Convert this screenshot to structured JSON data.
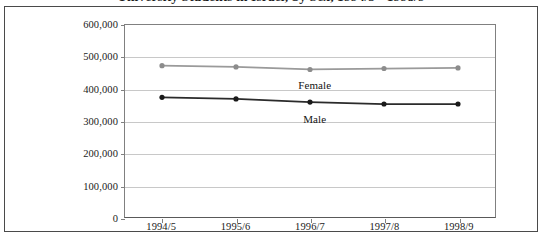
{
  "chart_data": {
    "type": "line",
    "title": "University Students in Israel, by Sex, 1994/5 - 1998/9",
    "xlabel": "",
    "ylabel": "",
    "categories": [
      "1994/5",
      "1995/6",
      "1996/7",
      "1997/8",
      "1998/9"
    ],
    "series": [
      {
        "name": "Female",
        "color": "#9a9a9a",
        "marker_color": "#8c8c8c",
        "values": [
          473000,
          469000,
          461000,
          464000,
          466000
        ],
        "label_x_index": 2.05,
        "label_y": 432000
      },
      {
        "name": "Male",
        "color": "#2b2b2b",
        "marker_color": "#1a1a1a",
        "values": [
          374000,
          369000,
          359000,
          353000,
          353000
        ],
        "label_x_index": 2.05,
        "label_y": 327000
      }
    ],
    "ylim": [
      0,
      600000
    ],
    "ytick_values": [
      0,
      100000,
      200000,
      300000,
      400000,
      500000,
      600000
    ],
    "ytick_labels": [
      "0",
      "100,000",
      "200,000",
      "300,000",
      "400,000",
      "500,000",
      "600,000"
    ],
    "grid": true,
    "grid_color": "#c8c8c8",
    "legend_position": "inline-annotation",
    "plot_border_color": "#808080",
    "frame_border_color": "#4a4a4a",
    "background_color": "#ffffff"
  }
}
